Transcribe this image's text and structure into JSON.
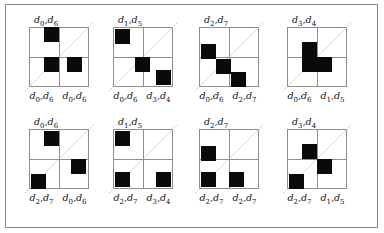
{
  "figure": {
    "type": "grid-diagram-panels",
    "background_color": "#ffffff",
    "frame_border_color": "#8a8a8a",
    "cell_fill_color": "#0a0a0a",
    "gridline_color": "#8e8e8e",
    "diagonal_style": "dotted",
    "grid_rows": 2,
    "grid_cols": 2,
    "panels": [
      {
        "id": "panel-1",
        "top_label": "d0,d6",
        "bottom_label_left": "d0,d6",
        "bottom_label_right": "d0,d6",
        "blocks": [
          {
            "x": 15,
            "y": 0,
            "w": 15,
            "h": 15
          },
          {
            "x": 15,
            "y": 30,
            "w": 15,
            "h": 15
          },
          {
            "x": 38,
            "y": 30,
            "w": 15,
            "h": 15
          }
        ]
      },
      {
        "id": "panel-2",
        "top_label": "d1,d5",
        "bottom_label_left": "d0,d6",
        "bottom_label_right": "d3,d4",
        "blocks": [
          {
            "x": 2,
            "y": 2,
            "w": 15,
            "h": 15
          },
          {
            "x": 22,
            "y": 30,
            "w": 15,
            "h": 15
          },
          {
            "x": 43,
            "y": 43,
            "w": 15,
            "h": 15
          }
        ]
      },
      {
        "id": "panel-3",
        "top_label": "d2,d7",
        "bottom_label_left": "d0,d6",
        "bottom_label_right": "d2,d7",
        "blocks": [
          {
            "x": 2,
            "y": 17,
            "w": 15,
            "h": 15
          },
          {
            "x": 17,
            "y": 32,
            "w": 15,
            "h": 15
          },
          {
            "x": 32,
            "y": 45,
            "w": 15,
            "h": 15
          }
        ]
      },
      {
        "id": "panel-4",
        "top_label": "d3,d4",
        "bottom_label_left": "d0,d6",
        "bottom_label_right": "d1,d5",
        "blocks": [
          {
            "x": 15,
            "y": 15,
            "w": 15,
            "h": 30
          },
          {
            "x": 30,
            "y": 30,
            "w": 15,
            "h": 15
          }
        ]
      },
      {
        "id": "panel-5",
        "top_label": "d0,d6",
        "bottom_label_left": "d2,d7",
        "bottom_label_right": "d0,d6",
        "blocks": [
          {
            "x": 15,
            "y": 2,
            "w": 15,
            "h": 15
          },
          {
            "x": 42,
            "y": 30,
            "w": 15,
            "h": 15
          },
          {
            "x": 2,
            "y": 45,
            "w": 15,
            "h": 15
          }
        ]
      },
      {
        "id": "panel-6",
        "top_label": "d1,d5",
        "bottom_label_left": "d2,d7",
        "bottom_label_right": "d3,d4",
        "blocks": [
          {
            "x": 2,
            "y": 2,
            "w": 15,
            "h": 15
          },
          {
            "x": 2,
            "y": 43,
            "w": 15,
            "h": 15
          },
          {
            "x": 43,
            "y": 43,
            "w": 15,
            "h": 15
          }
        ]
      },
      {
        "id": "panel-7",
        "top_label": "d2,d7",
        "bottom_label_left": "d2,d7",
        "bottom_label_right": "d2,d7",
        "blocks": [
          {
            "x": 2,
            "y": 17,
            "w": 15,
            "h": 15
          },
          {
            "x": 2,
            "y": 43,
            "w": 15,
            "h": 15
          },
          {
            "x": 30,
            "y": 43,
            "w": 15,
            "h": 15
          }
        ]
      },
      {
        "id": "panel-8",
        "top_label": "d3,d4",
        "bottom_label_left": "d2,d7",
        "bottom_label_right": "d1,d5",
        "blocks": [
          {
            "x": 15,
            "y": 15,
            "w": 15,
            "h": 15
          },
          {
            "x": 30,
            "y": 30,
            "w": 15,
            "h": 15
          },
          {
            "x": 2,
            "y": 45,
            "w": 15,
            "h": 15
          }
        ]
      }
    ]
  }
}
